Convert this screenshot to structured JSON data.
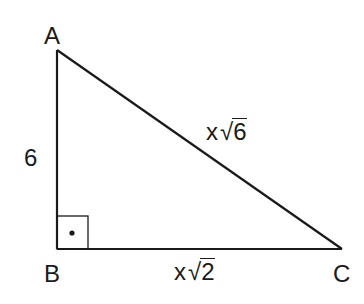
{
  "diagram": {
    "type": "right-triangle",
    "colors": {
      "stroke": "#1a1a1a",
      "background": "#ffffff"
    },
    "vertices": [
      {
        "id": "A",
        "label": "A",
        "x": 57,
        "y": 50
      },
      {
        "id": "B",
        "label": "B",
        "x": 57,
        "y": 249
      },
      {
        "id": "C",
        "label": "C",
        "x": 342,
        "y": 249
      }
    ],
    "right_angle_at": "B",
    "right_angle_marker": {
      "size": 31,
      "dot": true
    },
    "sides": {
      "AB": {
        "label": "6",
        "variable": "",
        "radicand": ""
      },
      "AC": {
        "label": "x√6",
        "variable": "x",
        "radicand": "6"
      },
      "BC": {
        "label": "x√2",
        "variable": "x",
        "radicand": "2"
      }
    },
    "root_sign": "√"
  }
}
